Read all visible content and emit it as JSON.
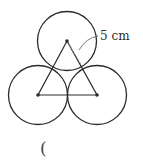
{
  "diagram": {
    "radius_label": "5 cm",
    "answer_blank": "(",
    "circles": [
      {
        "cx": 67,
        "cy": 41,
        "r": 29.5
      },
      {
        "cx": 38,
        "cy": 95,
        "r": 29.5
      },
      {
        "cx": 97,
        "cy": 95,
        "r": 29.5
      }
    ],
    "triangle": {
      "points": "67,41 38,95 97,95"
    },
    "colors": {
      "stroke": "#2b2b2b",
      "dashed": "#9a9a9a"
    }
  }
}
